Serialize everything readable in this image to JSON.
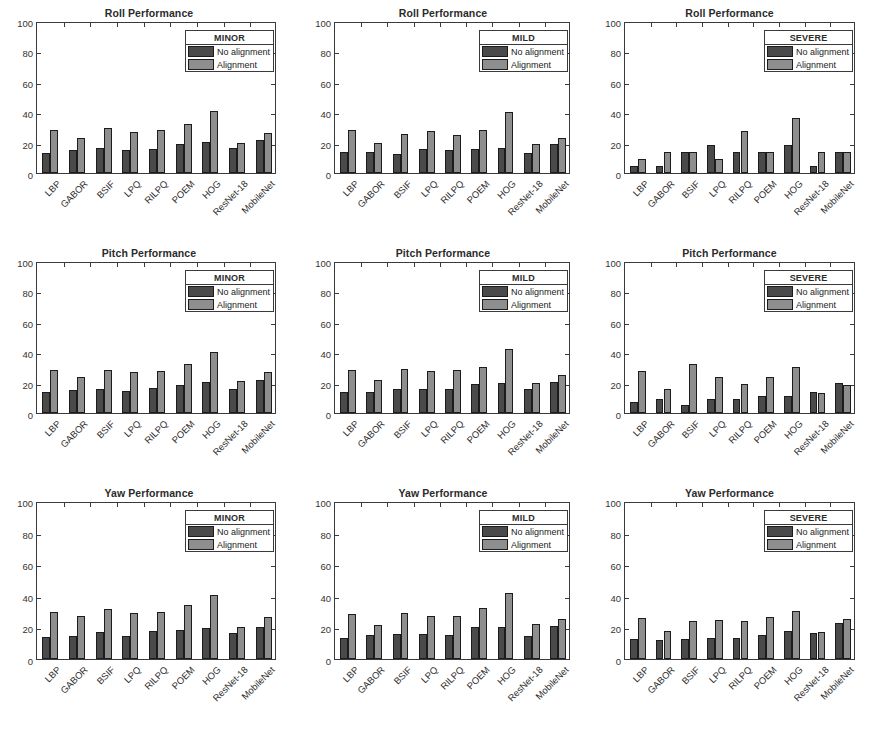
{
  "figure": {
    "rows": [
      "Roll",
      "Pitch",
      "Yaw"
    ],
    "columns": [
      "MINOR",
      "MILD",
      "SEVERE"
    ],
    "series_colors": {
      "no_alignment": "#4a4a4a",
      "alignment": "#8e8e8e"
    },
    "axis_color": "#3a3a3a",
    "background": "#ffffff"
  },
  "legend": {
    "series": [
      {
        "name": "No alignment",
        "color": "#4a4a4a"
      },
      {
        "name": "Alignment",
        "color": "#8e8e8e"
      }
    ]
  },
  "chart_data": [
    {
      "id": "roll-minor",
      "type": "bar",
      "title": "Roll Performance",
      "legend_title": "MINOR",
      "legend_position": "top-right-inside",
      "xlabel": "",
      "ylabel": "",
      "ylim": [
        0,
        100
      ],
      "yticks": [
        0,
        20,
        40,
        60,
        80,
        100
      ],
      "grid": false,
      "categories": [
        "LBP",
        "GABOR",
        "BSIF",
        "LPQ",
        "RILPQ",
        "POEM",
        "HOG",
        "ResNet-18",
        "MobileNet"
      ],
      "series": [
        {
          "name": "No alignment",
          "values": [
            13,
            15,
            16.5,
            15,
            16,
            19,
            20.5,
            16.5,
            22
          ]
        },
        {
          "name": "Alignment",
          "values": [
            28.5,
            23,
            29.5,
            27,
            28,
            32,
            40.5,
            20,
            26.5
          ]
        }
      ]
    },
    {
      "id": "roll-mild",
      "type": "bar",
      "title": "Roll Performance",
      "legend_title": "MILD",
      "legend_position": "top-right-inside",
      "xlabel": "",
      "ylabel": "",
      "ylim": [
        0,
        100
      ],
      "yticks": [
        0,
        20,
        40,
        60,
        80,
        100
      ],
      "grid": false,
      "categories": [
        "LBP",
        "GABOR",
        "BSIF",
        "LPQ",
        "RILPQ",
        "POEM",
        "HOG",
        "ResNet-18",
        "MobileNet"
      ],
      "series": [
        {
          "name": "No alignment",
          "values": [
            14,
            13.5,
            12.5,
            15.5,
            15,
            16,
            16.5,
            13,
            19
          ]
        },
        {
          "name": "Alignment",
          "values": [
            28,
            20,
            25.5,
            27.5,
            25,
            28.5,
            40,
            19,
            23
          ]
        }
      ]
    },
    {
      "id": "roll-severe",
      "type": "bar",
      "title": "Roll Performance",
      "legend_title": "SEVERE",
      "legend_position": "top-right-inside",
      "xlabel": "",
      "ylabel": "",
      "ylim": [
        0,
        100
      ],
      "yticks": [
        0,
        20,
        40,
        60,
        80,
        100
      ],
      "grid": false,
      "categories": [
        "LBP",
        "GABOR",
        "BSIF",
        "LPQ",
        "RILPQ",
        "POEM",
        "HOG",
        "ResNet-18",
        "MobileNet"
      ],
      "series": [
        {
          "name": "No alignment",
          "values": [
            4.5,
            4.5,
            14,
            18.5,
            13.5,
            14,
            18.5,
            4.5,
            14
          ]
        },
        {
          "name": "Alignment",
          "values": [
            9.5,
            14,
            14,
            9.5,
            27.5,
            14,
            36.5,
            14,
            14
          ]
        }
      ]
    },
    {
      "id": "pitch-minor",
      "type": "bar",
      "title": "Pitch Performance",
      "legend_title": "MINOR",
      "legend_position": "top-right-inside",
      "xlabel": "",
      "ylabel": "",
      "ylim": [
        0,
        100
      ],
      "yticks": [
        0,
        20,
        40,
        60,
        80,
        100
      ],
      "grid": false,
      "categories": [
        "LBP",
        "GABOR",
        "BSIF",
        "LPQ",
        "RILPQ",
        "POEM",
        "HOG",
        "ResNet-18",
        "MobileNet"
      ],
      "series": [
        {
          "name": "No alignment",
          "values": [
            13.5,
            15,
            16,
            14.5,
            16.5,
            18.5,
            20.5,
            15.5,
            22
          ]
        },
        {
          "name": "Alignment",
          "values": [
            28,
            23.5,
            28,
            27,
            27.5,
            32,
            40,
            21,
            27
          ]
        }
      ]
    },
    {
      "id": "pitch-mild",
      "type": "bar",
      "title": "Pitch Performance",
      "legend_title": "MILD",
      "legend_position": "top-right-inside",
      "xlabel": "",
      "ylabel": "",
      "ylim": [
        0,
        100
      ],
      "yticks": [
        0,
        20,
        40,
        60,
        80,
        100
      ],
      "grid": false,
      "categories": [
        "LBP",
        "GABOR",
        "BSIF",
        "LPQ",
        "RILPQ",
        "POEM",
        "HOG",
        "ResNet-18",
        "MobileNet"
      ],
      "series": [
        {
          "name": "No alignment",
          "values": [
            13.5,
            14,
            15.5,
            16,
            16,
            19,
            19.5,
            16,
            20.5
          ]
        },
        {
          "name": "Alignment",
          "values": [
            28.5,
            21.5,
            29,
            27.5,
            28,
            30.5,
            42,
            20,
            25
          ]
        }
      ]
    },
    {
      "id": "pitch-severe",
      "type": "bar",
      "title": "Pitch Performance",
      "legend_title": "SEVERE",
      "legend_position": "top-right-inside",
      "xlabel": "",
      "ylabel": "",
      "ylim": [
        0,
        100
      ],
      "yticks": [
        0,
        20,
        40,
        60,
        80,
        100
      ],
      "grid": false,
      "categories": [
        "LBP",
        "GABOR",
        "BSIF",
        "LPQ",
        "RILPQ",
        "POEM",
        "HOG",
        "ResNet-18",
        "MobileNet"
      ],
      "series": [
        {
          "name": "No alignment",
          "values": [
            7.5,
            9,
            5.5,
            9,
            9,
            11.5,
            11.5,
            14,
            20
          ]
        },
        {
          "name": "Alignment",
          "values": [
            27.5,
            15.5,
            32.5,
            24,
            19,
            24,
            30.5,
            13,
            18.5
          ]
        }
      ]
    },
    {
      "id": "yaw-minor",
      "type": "bar",
      "title": "Yaw Performance",
      "legend_title": "MINOR",
      "legend_position": "top-right-inside",
      "xlabel": "",
      "ylabel": "",
      "ylim": [
        0,
        100
      ],
      "yticks": [
        0,
        20,
        40,
        60,
        80,
        100
      ],
      "grid": false,
      "categories": [
        "LBP",
        "GABOR",
        "BSIF",
        "LPQ",
        "RILPQ",
        "POEM",
        "HOG",
        "ResNet-18",
        "MobileNet"
      ],
      "series": [
        {
          "name": "No alignment",
          "values": [
            14,
            14.5,
            17,
            14.5,
            18,
            18.5,
            19.5,
            16.5,
            20.5
          ]
        },
        {
          "name": "Alignment",
          "values": [
            30,
            27,
            31.5,
            29,
            30,
            34.5,
            40.5,
            20,
            26.5
          ]
        }
      ]
    },
    {
      "id": "yaw-mild",
      "type": "bar",
      "title": "Yaw Performance",
      "legend_title": "MILD",
      "legend_position": "top-right-inside",
      "xlabel": "",
      "ylabel": "",
      "ylim": [
        0,
        100
      ],
      "yticks": [
        0,
        20,
        40,
        60,
        80,
        100
      ],
      "grid": false,
      "categories": [
        "LBP",
        "GABOR",
        "BSIF",
        "LPQ",
        "RILPQ",
        "POEM",
        "HOG",
        "ResNet-18",
        "MobileNet"
      ],
      "series": [
        {
          "name": "No alignment",
          "values": [
            13,
            15.5,
            16,
            16,
            15.5,
            20,
            20.5,
            14.5,
            21
          ]
        },
        {
          "name": "Alignment",
          "values": [
            28.5,
            21.5,
            29,
            27.5,
            27.5,
            32,
            42,
            22,
            25.5
          ]
        }
      ]
    },
    {
      "id": "yaw-severe",
      "type": "bar",
      "title": "Yaw Performance",
      "legend_title": "SEVERE",
      "legend_position": "top-right-inside",
      "xlabel": "",
      "ylabel": "",
      "ylim": [
        0,
        100
      ],
      "yticks": [
        0,
        20,
        40,
        60,
        80,
        100
      ],
      "grid": false,
      "categories": [
        "LBP",
        "GABOR",
        "BSIF",
        "LPQ",
        "RILPQ",
        "POEM",
        "HOG",
        "ResNet-18",
        "MobileNet"
      ],
      "series": [
        {
          "name": "No alignment",
          "values": [
            12.5,
            12,
            12.5,
            13.5,
            13.5,
            15,
            18,
            16.5,
            23
          ]
        },
        {
          "name": "Alignment",
          "values": [
            26,
            18,
            24,
            24.5,
            24,
            26.5,
            30.5,
            17,
            25.5
          ]
        }
      ]
    }
  ]
}
